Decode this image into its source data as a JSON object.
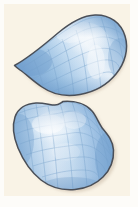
{
  "figure": {
    "caption": "",
    "background_color": "#fbf4e9",
    "page_margin_color": "#fdfcf8",
    "width": 138,
    "height": 207,
    "surface_count": 2
  },
  "palette": {
    "outline": "#4a4f58",
    "outline_soft": "#6b7280",
    "mesh_line": "#7fa8cf",
    "mesh_line_light": "#9dc0e0",
    "fill_dark_blue": "#7ba7d4",
    "fill_mid_blue": "#a8c8e6",
    "fill_light_blue": "#d2e4f4",
    "fill_highlight": "#fbfdff",
    "shadow": "#c9b9a6"
  },
  "surfaces": [
    {
      "id": "surface-top",
      "name": "teardrop-saddle-surface",
      "label": "",
      "description": "Teardrop shaped surface with a sharp cusp at the left and a broad rounded lobe at the right",
      "bounds": {
        "x": 14,
        "y": 14,
        "width": 112,
        "height": 88
      },
      "mesh_rows": 6,
      "mesh_cols": 7,
      "highlight_center": {
        "x": 83,
        "y": 44
      }
    },
    {
      "id": "surface-bottom",
      "name": "dome-blob-surface",
      "label": "",
      "description": "Rounded dome-like blob surface, wide and slightly heart shaped with a dip along the top edge",
      "bounds": {
        "x": 12,
        "y": 101,
        "width": 102,
        "height": 90
      },
      "mesh_rows": 6,
      "mesh_cols": 7,
      "highlight_center": {
        "x": 62,
        "y": 134
      }
    }
  ]
}
